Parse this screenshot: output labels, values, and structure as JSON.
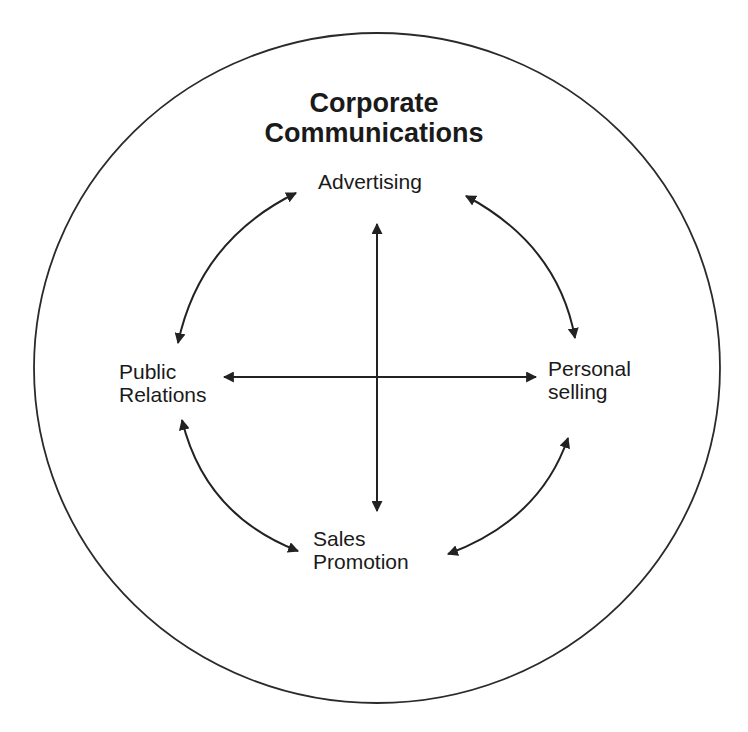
{
  "diagram": {
    "title_lines": [
      "Corporate",
      "Communications"
    ],
    "nodes": {
      "top": {
        "lines": [
          "Advertising"
        ]
      },
      "left": {
        "lines": [
          "Public",
          "Relations"
        ]
      },
      "right": {
        "lines": [
          "Personal",
          "selling"
        ]
      },
      "bottom": {
        "lines": [
          "Sales",
          "Promotion"
        ]
      }
    },
    "connections": [
      {
        "from": "Advertising",
        "to": "Sales Promotion",
        "type": "bidirectional-straight"
      },
      {
        "from": "Public Relations",
        "to": "Personal selling",
        "type": "bidirectional-straight"
      },
      {
        "from": "Advertising",
        "to": "Public Relations",
        "type": "bidirectional-curved"
      },
      {
        "from": "Advertising",
        "to": "Personal selling",
        "type": "bidirectional-curved"
      },
      {
        "from": "Public Relations",
        "to": "Sales Promotion",
        "type": "bidirectional-curved"
      },
      {
        "from": "Personal selling",
        "to": "Sales Promotion",
        "type": "bidirectional-curved"
      }
    ],
    "colors": {
      "stroke": "#222222",
      "text": "#1a1a1a",
      "background": "#ffffff"
    }
  }
}
